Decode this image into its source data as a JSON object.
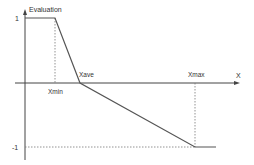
{
  "diagram": {
    "y_axis_label": "Evaluation",
    "x_axis_label": "X",
    "y_ticks": [
      {
        "label": "1",
        "value": 1
      },
      {
        "label": "-1",
        "value": -1
      }
    ],
    "x_markers": [
      {
        "label": "Xmin",
        "key": "xmin"
      },
      {
        "label": "Xave",
        "key": "xave"
      },
      {
        "label": "Xmax",
        "key": "xmax"
      }
    ],
    "curve": {
      "description": "Evaluation = 1 for x <= Xmin, falls linearly to 0 at Xave, then linearly to -1 at Xmax, -1 beyond",
      "points": [
        {
          "x": "0",
          "y": 1
        },
        {
          "x": "Xmin",
          "y": 1
        },
        {
          "x": "Xave",
          "y": 0
        },
        {
          "x": "Xmax",
          "y": -1
        },
        {
          "x": "beyond",
          "y": -1
        }
      ]
    },
    "colors": {
      "line": "#555555",
      "axis": "#444444",
      "guide": "#777777"
    }
  }
}
